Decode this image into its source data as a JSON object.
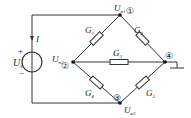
{
  "diagram": {
    "type": "circuit",
    "colors": {
      "wire": "#333333",
      "background": "#ffffff"
    },
    "source": {
      "label": "U",
      "label_sub": "s",
      "plus": "+",
      "minus": "−",
      "current_label": "I"
    },
    "nodes": [
      {
        "id": "1",
        "symbol": "①",
        "voltage": "U",
        "voltage_sub": "n1"
      },
      {
        "id": "2",
        "symbol": "②",
        "voltage": "U",
        "voltage_sub": "n2"
      },
      {
        "id": "3",
        "symbol": "③",
        "voltage": "U",
        "voltage_sub": "n3"
      },
      {
        "id": "4",
        "symbol": "④",
        "voltage": "",
        "voltage_sub": ""
      }
    ],
    "conductances": [
      {
        "label": "G",
        "sub": "1",
        "between": "2-1"
      },
      {
        "label": "G",
        "sub": "2",
        "between": "1-4"
      },
      {
        "label": "G",
        "sub": "3",
        "between": "2-4"
      },
      {
        "label": "G",
        "sub": "4",
        "between": "2-3"
      },
      {
        "label": "G",
        "sub": "5",
        "between": "3-4"
      }
    ],
    "ground": {
      "node": "4"
    }
  }
}
